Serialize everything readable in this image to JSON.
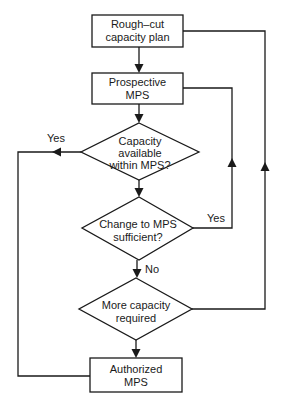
{
  "diagram": {
    "type": "flowchart",
    "colors": {
      "line": "#1a1a1a",
      "background": "#ffffff"
    },
    "nodes": [
      {
        "id": "rough_cut",
        "shape": "rectangle",
        "lines": [
          "Rough–cut",
          "capacity plan"
        ]
      },
      {
        "id": "prospective_mps",
        "shape": "rectangle",
        "lines": [
          "Prospective",
          "MPS"
        ]
      },
      {
        "id": "capacity_available",
        "shape": "diamond",
        "lines": [
          "Capacity",
          "available",
          "within MPS?"
        ]
      },
      {
        "id": "change_sufficient",
        "shape": "diamond",
        "lines": [
          "Change to MPS",
          "sufficient?"
        ]
      },
      {
        "id": "more_capacity",
        "shape": "diamond",
        "lines": [
          "More capacity",
          "required"
        ]
      },
      {
        "id": "authorized_mps",
        "shape": "rectangle",
        "lines": [
          "Authorized",
          "MPS"
        ]
      }
    ],
    "edges": [
      {
        "from": "rough_cut",
        "to": "prospective_mps",
        "label": ""
      },
      {
        "from": "prospective_mps",
        "to": "capacity_available",
        "label": ""
      },
      {
        "from": "capacity_available",
        "to": "authorized_mps",
        "label": "Yes"
      },
      {
        "from": "capacity_available",
        "to": "change_sufficient",
        "label": ""
      },
      {
        "from": "change_sufficient",
        "to": "prospective_mps",
        "label": "Yes"
      },
      {
        "from": "change_sufficient",
        "to": "more_capacity",
        "label": "No"
      },
      {
        "from": "more_capacity",
        "to": "rough_cut",
        "label": ""
      },
      {
        "from": "more_capacity",
        "to": "authorized_mps",
        "label": ""
      }
    ],
    "labels": {
      "yes_left": "Yes",
      "yes_right": "Yes",
      "no": "No"
    }
  }
}
